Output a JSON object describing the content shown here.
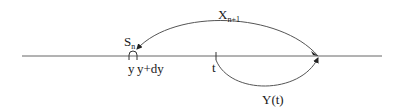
{
  "diagram": {
    "type": "renewal-process-schematic",
    "labels": {
      "s_n": {
        "base": "S",
        "sub": "n"
      },
      "x_n1": {
        "base": "X",
        "sub": "n+1"
      },
      "y": "y",
      "y_dy": "y+dy",
      "t": "t",
      "y_t": "Y(t)"
    },
    "colors": {
      "line": "#555555",
      "text": "#1a1a1a"
    }
  }
}
